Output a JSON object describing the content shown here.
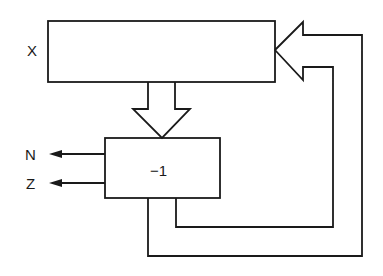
{
  "diagram": {
    "type": "block-diagram",
    "register": {
      "label": "X"
    },
    "decrementer": {
      "label": "−1"
    },
    "outputs": [
      {
        "label": "N"
      },
      {
        "label": "Z"
      }
    ],
    "connections": [
      {
        "from": "register",
        "to": "decrementer",
        "kind": "wide-arrow-down"
      },
      {
        "from": "decrementer",
        "to": "register",
        "kind": "wide-arrow-feedback-loop"
      },
      {
        "from": "decrementer",
        "to": "N",
        "kind": "arrow-left"
      },
      {
        "from": "decrementer",
        "to": "Z",
        "kind": "arrow-left"
      }
    ],
    "colors": {
      "stroke": "#1a1a1a",
      "background": "#ffffff"
    }
  }
}
